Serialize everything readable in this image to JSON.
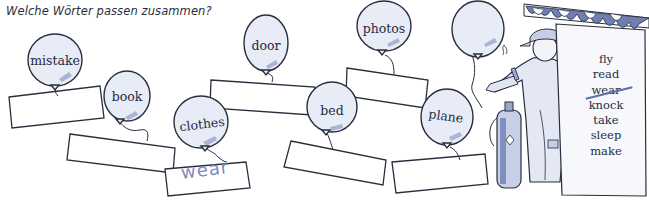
{
  "worksheet": {
    "instruction": "Welche Wörter passen zusammen?",
    "balloons": [
      {
        "label": "mistake"
      },
      {
        "label": "book"
      },
      {
        "label": "clothes"
      },
      {
        "label": "door"
      },
      {
        "label": "bed"
      },
      {
        "label": "photos"
      },
      {
        "label": "plane"
      },
      {
        "label": ""
      }
    ],
    "answer_boxes": [
      {
        "value": ""
      },
      {
        "value": ""
      },
      {
        "value": "wear"
      },
      {
        "value": ""
      },
      {
        "value": ""
      },
      {
        "value": ""
      },
      {
        "value": ""
      }
    ],
    "word_list": [
      {
        "word": "fly",
        "struck": false
      },
      {
        "word": "read",
        "struck": false
      },
      {
        "word": "wear",
        "struck": true
      },
      {
        "word": "knock",
        "struck": false
      },
      {
        "word": "take",
        "struck": false
      },
      {
        "word": "sleep",
        "struck": false
      },
      {
        "word": "make",
        "struck": false
      }
    ],
    "colors": {
      "balloon_fill": "#e6ebf5",
      "balloon_stroke": "#2a2d3d",
      "answer_text": "#7f8bbb",
      "awning": "#6f7fb3"
    }
  }
}
